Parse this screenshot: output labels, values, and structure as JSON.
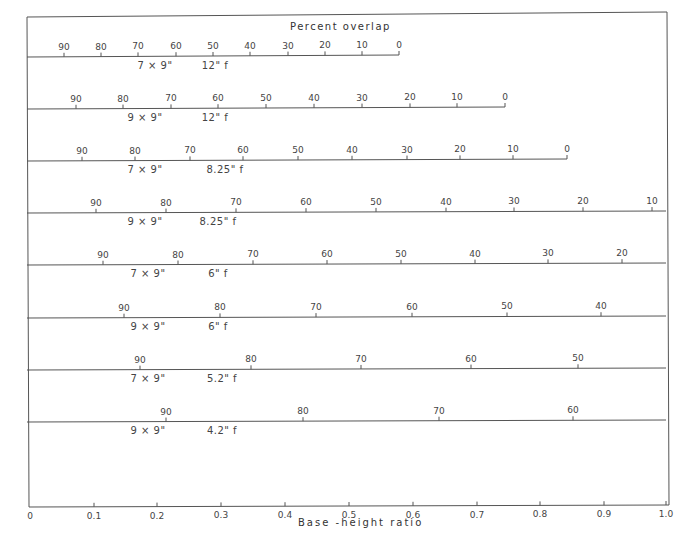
{
  "chart_data": {
    "type": "line",
    "title": "Percent overlap",
    "xlabel": "Base-height ratio",
    "ylabel": "",
    "xlim": [
      0,
      1.0
    ],
    "x_ticks": [
      "0",
      "0.1",
      "0.2",
      "0.3",
      "0.4",
      "0.5",
      "0.6",
      "0.7",
      "0.8",
      "0.9",
      "1.0"
    ],
    "grid": false,
    "legend": null,
    "series": [
      {
        "name": "7 x 9\" 12\" f",
        "format": "7 × 9\"",
        "focal": "12\" f",
        "overlap": [
          90,
          80,
          70,
          60,
          50,
          40,
          30,
          20,
          10,
          0
        ],
        "base_height": [
          0.05,
          0.11,
          0.17,
          0.23,
          0.29,
          0.35,
          0.41,
          0.47,
          0.53,
          0.58
        ]
      },
      {
        "name": "9 x 9\" 12\" f",
        "format": "9 × 9\"",
        "focal": "12\" f",
        "overlap": [
          90,
          80,
          70,
          60,
          50,
          40,
          30,
          20,
          10,
          0
        ],
        "base_height": [
          0.07,
          0.15,
          0.22,
          0.3,
          0.37,
          0.45,
          0.52,
          0.6,
          0.67,
          0.75
        ]
      },
      {
        "name": "7 x 9\" 8.25\" f",
        "format": "7 × 9\"",
        "focal": "8.25\" f",
        "overlap": [
          90,
          80,
          70,
          60,
          50,
          40,
          30,
          20,
          10,
          0
        ],
        "base_height": [
          0.08,
          0.17,
          0.25,
          0.34,
          0.42,
          0.51,
          0.59,
          0.68,
          0.76,
          0.85
        ]
      },
      {
        "name": "9 x 9\" 8.25\" f",
        "format": "9 × 9\"",
        "focal": "8.25\" f",
        "overlap": [
          90,
          80,
          70,
          60,
          50,
          40,
          30,
          20,
          10
        ],
        "base_height": [
          0.1,
          0.21,
          0.32,
          0.43,
          0.54,
          0.65,
          0.76,
          0.87,
          0.98
        ]
      },
      {
        "name": "7 x 9\" 6\" f",
        "format": "7 × 9\"",
        "focal": "6\" f",
        "overlap": [
          90,
          80,
          70,
          60,
          50,
          40,
          30,
          20
        ],
        "base_height": [
          0.12,
          0.23,
          0.35,
          0.47,
          0.58,
          0.7,
          0.82,
          0.93
        ]
      },
      {
        "name": "9 x 9\" 6\" f",
        "format": "9 × 9\"",
        "focal": "6\" f",
        "overlap": [
          90,
          80,
          70,
          60,
          50,
          40
        ],
        "base_height": [
          0.15,
          0.3,
          0.45,
          0.6,
          0.75,
          0.9
        ]
      },
      {
        "name": "7 x 9\" 5.2\" f",
        "format": "7 × 9\"",
        "focal": "5.2\" f",
        "overlap": [
          90,
          80,
          70,
          60,
          50
        ],
        "base_height": [
          0.17,
          0.35,
          0.52,
          0.69,
          0.86
        ]
      },
      {
        "name": "9 x 9\" 4.2\" f",
        "format": "9 × 9\"",
        "focal": "4.2\" f",
        "overlap": [
          90,
          80,
          70,
          60
        ],
        "base_height": [
          0.21,
          0.43,
          0.64,
          0.85
        ]
      }
    ]
  },
  "title": "Percent overlap",
  "x_axis": {
    "label": "Base -height  ratio",
    "ticks": [
      {
        "label": "0",
        "x": 30
      },
      {
        "label": "0.1",
        "x": 94
      },
      {
        "label": "0.2",
        "x": 157
      },
      {
        "label": "0.3",
        "x": 221
      },
      {
        "label": "0.4",
        "x": 285
      },
      {
        "label": "0.5",
        "x": 349
      },
      {
        "label": "0.6",
        "x": 413
      },
      {
        "label": "0.7",
        "x": 477
      },
      {
        "label": "0.8",
        "x": 540
      },
      {
        "label": "0.9",
        "x": 604
      },
      {
        "label": "1.0",
        "x": 666
      }
    ]
  },
  "scales": [
    {
      "format": "7 × 9\"",
      "focal": "12\" f",
      "y": 57,
      "end_x": 399,
      "format_x": 155,
      "focal_x": 215,
      "ticks": [
        {
          "v": "90",
          "x": 64
        },
        {
          "v": "80",
          "x": 101
        },
        {
          "v": "70",
          "x": 138
        },
        {
          "v": "60",
          "x": 176
        },
        {
          "v": "50",
          "x": 213
        },
        {
          "v": "40",
          "x": 250
        },
        {
          "v": "30",
          "x": 288
        },
        {
          "v": "20",
          "x": 325
        },
        {
          "v": "10",
          "x": 362
        },
        {
          "v": "0",
          "x": 399
        }
      ]
    },
    {
      "format": "9 × 9\"",
      "focal": "12\" f",
      "y": 109,
      "end_x": 505,
      "format_x": 145,
      "focal_x": 215,
      "ticks": [
        {
          "v": "90",
          "x": 76
        },
        {
          "v": "80",
          "x": 123
        },
        {
          "v": "70",
          "x": 171
        },
        {
          "v": "60",
          "x": 218
        },
        {
          "v": "50",
          "x": 266
        },
        {
          "v": "40",
          "x": 314
        },
        {
          "v": "30",
          "x": 362
        },
        {
          "v": "20",
          "x": 410
        },
        {
          "v": "10",
          "x": 457
        },
        {
          "v": "0",
          "x": 505
        }
      ]
    },
    {
      "format": "7 × 9\"",
      "focal": "8.25\" f",
      "y": 161,
      "end_x": 567,
      "format_x": 145,
      "focal_x": 225,
      "ticks": [
        {
          "v": "90",
          "x": 82
        },
        {
          "v": "80",
          "x": 135
        },
        {
          "v": "70",
          "x": 190
        },
        {
          "v": "60",
          "x": 243
        },
        {
          "v": "50",
          "x": 298
        },
        {
          "v": "40",
          "x": 352
        },
        {
          "v": "30",
          "x": 407
        },
        {
          "v": "20",
          "x": 460
        },
        {
          "v": "10",
          "x": 513
        },
        {
          "v": "0",
          "x": 567
        }
      ]
    },
    {
      "format": "9 × 9\"",
      "focal": "8.25\" f",
      "y": 213,
      "end_x": 666,
      "format_x": 145,
      "focal_x": 218,
      "ticks": [
        {
          "v": "90",
          "x": 96
        },
        {
          "v": "80",
          "x": 166
        },
        {
          "v": "70",
          "x": 236
        },
        {
          "v": "60",
          "x": 306
        },
        {
          "v": "50",
          "x": 376
        },
        {
          "v": "40",
          "x": 446
        },
        {
          "v": "30",
          "x": 514
        },
        {
          "v": "20",
          "x": 583
        },
        {
          "v": "10",
          "x": 652
        }
      ]
    },
    {
      "format": "7 × 9\"",
      "focal": "6\" f",
      "y": 265,
      "end_x": 666,
      "format_x": 148,
      "focal_x": 218,
      "ticks": [
        {
          "v": "90",
          "x": 103
        },
        {
          "v": "80",
          "x": 178
        },
        {
          "v": "70",
          "x": 253
        },
        {
          "v": "60",
          "x": 327
        },
        {
          "v": "50",
          "x": 401
        },
        {
          "v": "40",
          "x": 475
        },
        {
          "v": "30",
          "x": 548
        },
        {
          "v": "20",
          "x": 622
        }
      ]
    },
    {
      "format": "9 × 9\"",
      "focal": "6\" f",
      "y": 318,
      "end_x": 666,
      "format_x": 148,
      "focal_x": 218,
      "ticks": [
        {
          "v": "90",
          "x": 124
        },
        {
          "v": "80",
          "x": 220
        },
        {
          "v": "70",
          "x": 316
        },
        {
          "v": "60",
          "x": 412
        },
        {
          "v": "50",
          "x": 507
        },
        {
          "v": "40",
          "x": 601
        }
      ]
    },
    {
      "format": "7 × 9\"",
      "focal": "5.2\" f",
      "y": 370,
      "end_x": 666,
      "format_x": 148,
      "focal_x": 222,
      "ticks": [
        {
          "v": "90",
          "x": 140
        },
        {
          "v": "80",
          "x": 251
        },
        {
          "v": "70",
          "x": 361
        },
        {
          "v": "60",
          "x": 471
        },
        {
          "v": "50",
          "x": 578
        }
      ]
    },
    {
      "format": "9 × 9\"",
      "focal": "4.2\" f",
      "y": 422,
      "end_x": 666,
      "format_x": 148,
      "focal_x": 222,
      "ticks": [
        {
          "v": "90",
          "x": 166
        },
        {
          "v": "80",
          "x": 303
        },
        {
          "v": "70",
          "x": 439
        },
        {
          "v": "60",
          "x": 573
        }
      ]
    }
  ]
}
